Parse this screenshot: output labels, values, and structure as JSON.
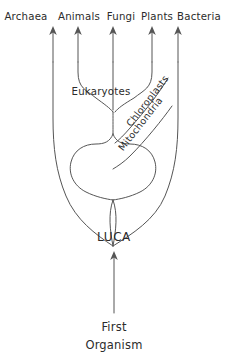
{
  "diagram": {
    "line_color": "#555555",
    "text_color": "#2b2b2b",
    "background_color": "#ffffff",
    "tip_labels": [
      {
        "name": "archaea",
        "text": "Archaea",
        "x": 26,
        "y": 20
      },
      {
        "name": "animals",
        "text": "Animals",
        "x": 62,
        "y": 20
      },
      {
        "name": "fungi",
        "text": "Fungi",
        "x": 113,
        "y": 20
      },
      {
        "name": "plants",
        "text": "Plants",
        "x": 152,
        "y": 20
      },
      {
        "name": "bacteria",
        "text": "Bacteria",
        "x": 198,
        "y": 20
      }
    ],
    "inner_labels": [
      {
        "name": "eukaryotes",
        "text": "Eukaryotes",
        "x": 101,
        "y": 95
      },
      {
        "name": "chloroplasts",
        "text": "Chloroplasts",
        "x": 150,
        "y": 103,
        "rotation": -52
      },
      {
        "name": "mitochondria",
        "text": "Mitochondria",
        "x": 143,
        "y": 124,
        "rotation": -52
      }
    ],
    "root_labels": [
      {
        "name": "luca",
        "text": "LUCA",
        "x": 114,
        "y": 241
      },
      {
        "name": "first-organism-line-1",
        "text": "First",
        "x": 114,
        "y": 331
      },
      {
        "name": "first-organism-line-2",
        "text": "Organism",
        "x": 114,
        "y": 349
      }
    ],
    "arrows": [
      {
        "name": "archaea-arrow",
        "x": 53,
        "tip_y": 28,
        "base_y": 60
      },
      {
        "name": "animals-arrow",
        "x": 78,
        "tip_y": 28,
        "base_y": 60
      },
      {
        "name": "fungi-arrow",
        "x": 113,
        "tip_y": 28,
        "base_y": 60
      },
      {
        "name": "plants-arrow",
        "x": 152,
        "tip_y": 28,
        "base_y": 60
      },
      {
        "name": "bacteria-arrow",
        "x": 178,
        "tip_y": 28,
        "base_y": 60
      },
      {
        "name": "first-organism-arrow",
        "x": 114,
        "tip_y": 252,
        "base_y": 313
      }
    ]
  }
}
